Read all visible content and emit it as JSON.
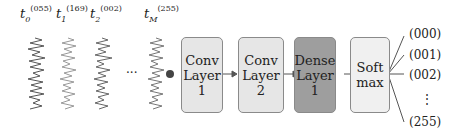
{
  "inputs": [
    {
      "sym": "t",
      "sub": "0",
      "sup": "(055)"
    },
    {
      "sym": "t",
      "sub": "1",
      "sup": "(169)"
    },
    {
      "sym": "t",
      "sub": "2",
      "sup": "(002)"
    },
    {
      "sym": "t",
      "sub": "M",
      "sup": "(255)"
    }
  ],
  "ellipsis": "···",
  "layers": [
    {
      "label": "Conv\nLayer\n1",
      "color": "#e6e6e6"
    },
    {
      "label": "Conv\nLayer\n2",
      "color": "#e6e6e6"
    },
    {
      "label": "Dense\nLayer\n1",
      "color": "#9e9e9e"
    },
    {
      "label": "Soft\nmax",
      "color": "#f0f0f0"
    }
  ],
  "outputs": [
    "(000)",
    "(001)",
    "(002)",
    "⋮",
    "(255)"
  ]
}
